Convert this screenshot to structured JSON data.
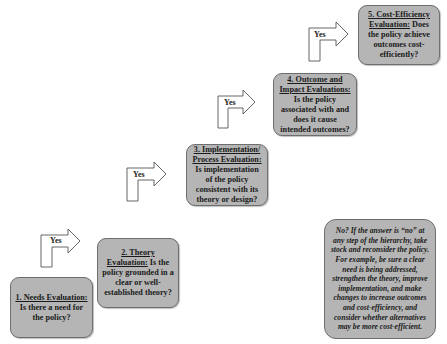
{
  "steps": [
    {
      "title": "1. Needs Evaluation:",
      "body": "Is there a need for the policy?"
    },
    {
      "title": "2. Theory Evaluation:",
      "body": "Is the policy grounded in a clear or well-established theory?"
    },
    {
      "title": "3. Implementation/ Process Evaluation:",
      "body": "Is implementation of the policy consistent with its theory or design?"
    },
    {
      "title": "4. Outcome and Impact Evaluations:",
      "body": "Is the policy associated with and does it cause intended outcomes?"
    },
    {
      "title": "5. Cost-Efficiency Evaluation:",
      "body": "Does the policy achieve outcomes cost-efficiently?"
    }
  ],
  "arrows": [
    {
      "label": "Yes"
    },
    {
      "label": "Yes"
    },
    {
      "label": "Yes"
    },
    {
      "label": "Yes"
    }
  ],
  "note": {
    "text": "No? If the answer is “no” at any step of the hierarchy, take stock and reconsider the policy.  For example, be sure a clear need is being addressed, strengthen the theory, improve implementation, and make changes to increase outcomes and cost-efficiency, and consider whether alternatives may be more cost-efficient."
  },
  "colors": {
    "box_fill": "#b5b5b5",
    "box_border": "#6e6e6e",
    "arrow_stroke": "#555555"
  }
}
